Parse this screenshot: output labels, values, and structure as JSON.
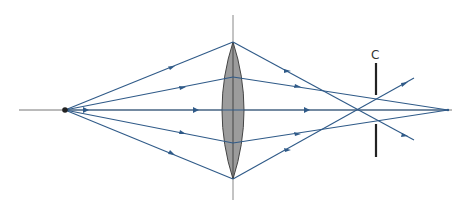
{
  "diagram": {
    "type": "ray-optics",
    "colors": {
      "ray": "#2f5a88",
      "axis": "#666666",
      "lens_fill": "#9a9a9a",
      "lens_stroke": "#444444",
      "screen": "#222222",
      "source": "#222222"
    },
    "source": {
      "x": 65,
      "y": 110
    },
    "lens": {
      "x": 233,
      "top": 42,
      "bottom": 179,
      "half_width": 11
    },
    "screen": {
      "label": "C",
      "x": 376,
      "label_y": 59
    },
    "focus_marginal": {
      "x": 358,
      "y": 110
    },
    "focus_paraxial": {
      "x": 448,
      "y": 110
    }
  }
}
